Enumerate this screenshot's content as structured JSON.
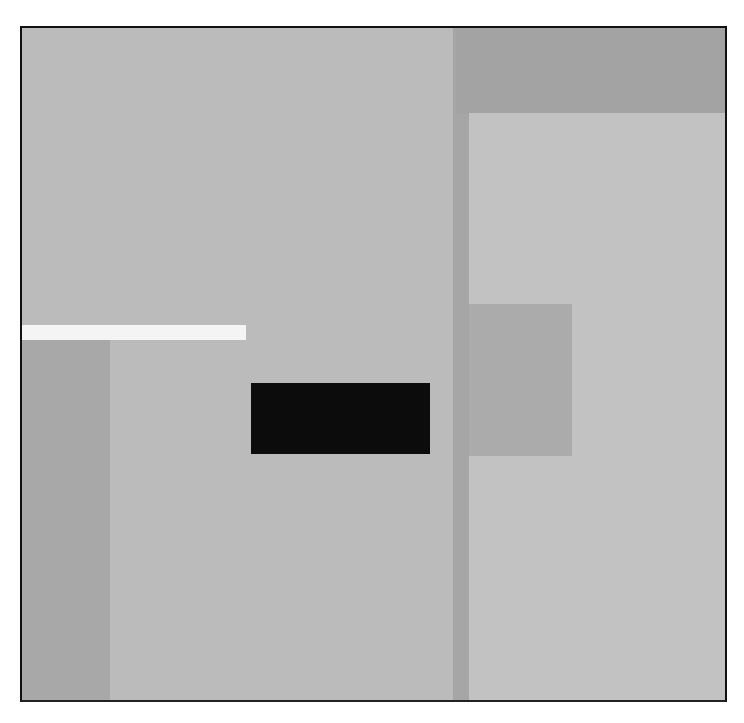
{
  "artwork": {
    "type": "abstract geometric painting",
    "palette": {
      "background": "#ffffff",
      "main_field": "#bbbbbb",
      "right_panel": "#c2c2c2",
      "vertical_strip": "#a6a6a6",
      "top_right_block": "#a3a3a3",
      "mid_square": "#ababab",
      "left_column": "#a8a8a8",
      "white_bar": "#f4f4f4",
      "black_rect": "#0c0c0c",
      "border": "#111111"
    },
    "blocks": [
      {
        "name": "main-field",
        "x": 20,
        "y": 26,
        "w": 707,
        "h": 676,
        "color": "#bbbbbb"
      },
      {
        "name": "vertical-strip",
        "x": 453,
        "y": 26,
        "w": 17,
        "h": 676,
        "color": "#a6a6a6"
      },
      {
        "name": "top-right-block",
        "x": 456,
        "y": 26,
        "w": 270,
        "h": 88,
        "color": "#a3a3a3"
      },
      {
        "name": "right-panel",
        "x": 469,
        "y": 113,
        "w": 258,
        "h": 589,
        "color": "#c2c2c2"
      },
      {
        "name": "mid-square",
        "x": 469,
        "y": 304,
        "w": 103,
        "h": 152,
        "color": "#ababab"
      },
      {
        "name": "white-bar",
        "x": 20,
        "y": 325,
        "w": 226,
        "h": 15,
        "color": "#f4f4f4"
      },
      {
        "name": "left-column",
        "x": 20,
        "y": 340,
        "w": 90,
        "h": 362,
        "color": "#a8a8a8"
      },
      {
        "name": "black-rect",
        "x": 251,
        "y": 383,
        "w": 179,
        "h": 71,
        "color": "#0c0c0c"
      }
    ]
  }
}
